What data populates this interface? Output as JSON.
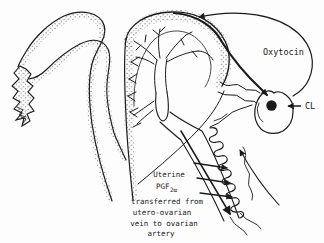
{
  "diagram": {
    "title_hint": "Uterine-ovarian hormone feedback diagram",
    "labels": {
      "oxytocin": "Oxytocin",
      "cl": "CL"
    },
    "caption": {
      "line1": "Uterine",
      "line2_main": "PGF",
      "line2_sub": "2α",
      "line3": "transferred from",
      "line4": "utero-ovarian",
      "line5": "vein to ovarian",
      "line6": "artery"
    },
    "colors": {
      "ink": "#1b1b1b",
      "stipple": "#2b2b2b",
      "background": "#fdfdfd"
    }
  }
}
